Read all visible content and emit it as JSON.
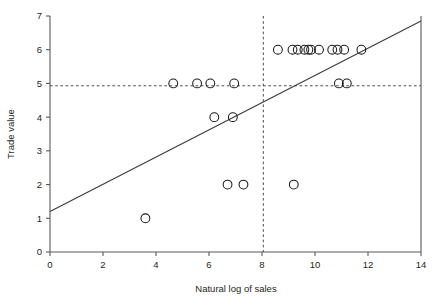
{
  "chart_data": {
    "type": "scatter",
    "title": "",
    "xlabel": "Natural log of sales",
    "ylabel": "Trade value",
    "xlim": [
      0,
      14
    ],
    "ylim": [
      0,
      7
    ],
    "xticks": [
      0,
      2,
      4,
      6,
      8,
      10,
      12,
      14
    ],
    "yticks": [
      0,
      1,
      2,
      3,
      4,
      5,
      6,
      7
    ],
    "xtick_labels": [
      "0",
      "2",
      "4",
      "6",
      "8",
      "10",
      "12",
      "14"
    ],
    "ytick_labels": [
      "0",
      "1",
      "2",
      "3",
      "4",
      "5",
      "6",
      "7"
    ],
    "grid": false,
    "legend": null,
    "marker": "open-circle",
    "marker_size": 4.4,
    "points": [
      {
        "x": 3.6,
        "y": 1
      },
      {
        "x": 6.7,
        "y": 2
      },
      {
        "x": 7.3,
        "y": 2
      },
      {
        "x": 9.2,
        "y": 2
      },
      {
        "x": 6.2,
        "y": 4
      },
      {
        "x": 6.9,
        "y": 4
      },
      {
        "x": 4.65,
        "y": 5
      },
      {
        "x": 5.55,
        "y": 5
      },
      {
        "x": 6.05,
        "y": 5
      },
      {
        "x": 6.95,
        "y": 5
      },
      {
        "x": 10.9,
        "y": 5
      },
      {
        "x": 11.2,
        "y": 5
      },
      {
        "x": 8.6,
        "y": 6
      },
      {
        "x": 9.15,
        "y": 6
      },
      {
        "x": 9.35,
        "y": 6
      },
      {
        "x": 9.6,
        "y": 6
      },
      {
        "x": 9.75,
        "y": 6
      },
      {
        "x": 9.85,
        "y": 6
      },
      {
        "x": 10.15,
        "y": 6
      },
      {
        "x": 10.65,
        "y": 6
      },
      {
        "x": 10.85,
        "y": 6
      },
      {
        "x": 11.1,
        "y": 6
      },
      {
        "x": 11.75,
        "y": 6
      }
    ],
    "fit_line": {
      "name": "regression-line",
      "x0": 0.0,
      "y0": 1.2,
      "x1": 14.0,
      "y1": 6.85
    },
    "reference_lines": [
      {
        "name": "horizontal-reference",
        "orientation": "horizontal",
        "value": 4.93
      },
      {
        "name": "vertical-reference",
        "orientation": "vertical",
        "value": 8.05
      }
    ]
  }
}
